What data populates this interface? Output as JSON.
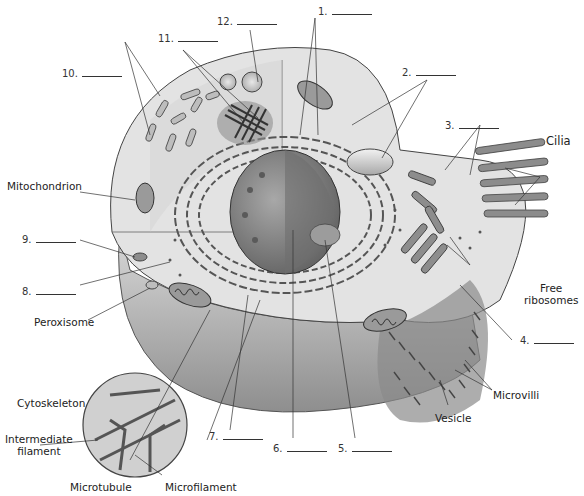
{
  "diagram": {
    "numbered_labels": [
      {
        "id": "1",
        "text": "1.",
        "blank": true
      },
      {
        "id": "2",
        "text": "2.",
        "blank": true
      },
      {
        "id": "3",
        "text": "3.",
        "blank": true
      },
      {
        "id": "4",
        "text": "4.",
        "blank": true
      },
      {
        "id": "5",
        "text": "5.",
        "blank": true
      },
      {
        "id": "6",
        "text": "6.",
        "blank": true
      },
      {
        "id": "7",
        "text": "7.",
        "blank": true
      },
      {
        "id": "8",
        "text": "8.",
        "blank": true
      },
      {
        "id": "9",
        "text": "9.",
        "blank": true
      },
      {
        "id": "10",
        "text": "10.",
        "blank": true
      },
      {
        "id": "11",
        "text": "11.",
        "blank": true
      },
      {
        "id": "12",
        "text": "12.",
        "blank": true
      }
    ],
    "named_labels": {
      "cilia": "Cilia",
      "mitochondrion": "Mitochondrion",
      "free_ribosomes_line1": "Free",
      "free_ribosomes_line2": "ribosomes",
      "peroxisome": "Peroxisome",
      "microvilli": "Microvilli",
      "vesicle": "Vesicle",
      "cytoskeleton": "Cytoskeleton",
      "intermediate_filament_line1": "Intermediate",
      "intermediate_filament_line2": "filament",
      "microtubule": "Microtubule",
      "microfilament": "Microfilament"
    },
    "colors": {
      "background": "#ffffff",
      "cytoplasm_light": "#e6e6e6",
      "cytoplasm_mid": "#cfcfcf",
      "membrane_shadow": "#9a9a9a",
      "nucleus": "#8a8a8a",
      "organelle": "#7a7a7a",
      "outline": "#333333"
    }
  }
}
